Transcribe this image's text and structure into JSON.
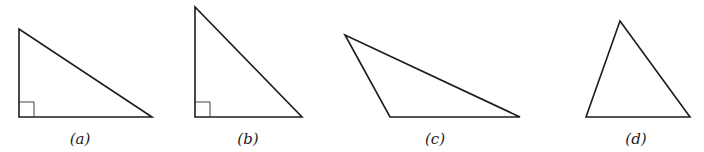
{
  "figure": {
    "triangles": [
      {
        "id": "a",
        "label": "(a)",
        "kind": "right triangle",
        "right_angle": true
      },
      {
        "id": "b",
        "label": "(b)",
        "kind": "right triangle",
        "right_angle": true
      },
      {
        "id": "c",
        "label": "(c)",
        "kind": "obtuse triangle",
        "right_angle": false
      },
      {
        "id": "d",
        "label": "(d)",
        "kind": "acute triangle",
        "right_angle": false
      }
    ],
    "colors": {
      "stroke": "#1c1c1c",
      "background": "#ffffff"
    }
  }
}
